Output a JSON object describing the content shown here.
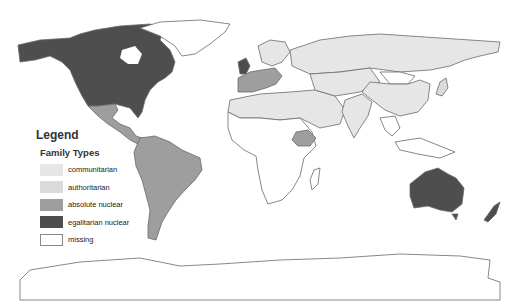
{
  "legend": {
    "title": "Legend",
    "subtitle": "Family Types",
    "items": [
      {
        "label": "communitarian",
        "color": "#e6e6e6"
      },
      {
        "label": "authoritarian",
        "color": "#dadada"
      },
      {
        "label": "absolute nuclear",
        "color": "#9e9e9e"
      },
      {
        "label": "egalitarian nuclear",
        "color": "#4e4e4e"
      },
      {
        "label": "missing",
        "color": "#ffffff"
      }
    ]
  },
  "regions": [
    {
      "name": "north-america",
      "family_type": "egalitarian nuclear"
    },
    {
      "name": "greenland",
      "family_type": "missing"
    },
    {
      "name": "central-america",
      "family_type": "absolute nuclear"
    },
    {
      "name": "south-america",
      "family_type": "absolute nuclear"
    },
    {
      "name": "uk-northwest-europe",
      "family_type": "egalitarian nuclear"
    },
    {
      "name": "western-europe",
      "family_type": "absolute nuclear"
    },
    {
      "name": "russia-north-asia",
      "family_type": "communitarian"
    },
    {
      "name": "middle-east-north-africa",
      "family_type": "communitarian"
    },
    {
      "name": "china",
      "family_type": "communitarian"
    },
    {
      "name": "india-south-asia",
      "family_type": "communitarian"
    },
    {
      "name": "mongolia",
      "family_type": "missing"
    },
    {
      "name": "japan",
      "family_type": "authoritarian"
    },
    {
      "name": "sub-saharan-africa",
      "family_type": "missing"
    },
    {
      "name": "ethiopia",
      "family_type": "absolute nuclear"
    },
    {
      "name": "southeast-asia",
      "family_type": "missing"
    },
    {
      "name": "australia",
      "family_type": "egalitarian nuclear"
    },
    {
      "name": "new-zealand",
      "family_type": "egalitarian nuclear"
    },
    {
      "name": "antarctica",
      "family_type": "missing"
    }
  ]
}
